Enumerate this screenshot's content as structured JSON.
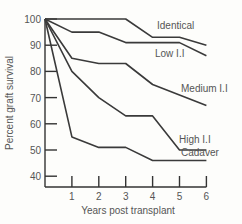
{
  "chart_data": {
    "type": "line",
    "title": "",
    "xlabel": "Years post transplant",
    "ylabel": "Percent graft survival",
    "x": [
      0,
      1,
      2,
      3,
      4,
      5,
      6
    ],
    "xticks": [
      "1",
      "2",
      "3",
      "4",
      "5",
      "6"
    ],
    "yticks": [
      "100",
      "90",
      "80",
      "70",
      "60",
      "50",
      "40"
    ],
    "xlim": [
      0,
      6
    ],
    "ylim": [
      36,
      100
    ],
    "grid": false,
    "legend": "inline labels at right end of lines",
    "series": [
      {
        "name": "Identical",
        "values": [
          100,
          100,
          100,
          100,
          93,
          93,
          90
        ]
      },
      {
        "name": "Low I.I",
        "values": [
          100,
          95,
          95,
          91,
          91,
          91,
          86
        ]
      },
      {
        "name": "Medium I.I",
        "values": [
          100,
          85,
          83,
          83,
          75,
          71,
          67
        ]
      },
      {
        "name": "High I.I",
        "values": [
          100,
          80,
          70,
          63,
          63,
          50,
          50
        ]
      },
      {
        "name": "Cadaver",
        "values": [
          100,
          55,
          51,
          51,
          46,
          46,
          46
        ]
      }
    ]
  },
  "labels": {
    "xlabel": "Years post transplant",
    "ylabel": "Percent graft survival"
  }
}
